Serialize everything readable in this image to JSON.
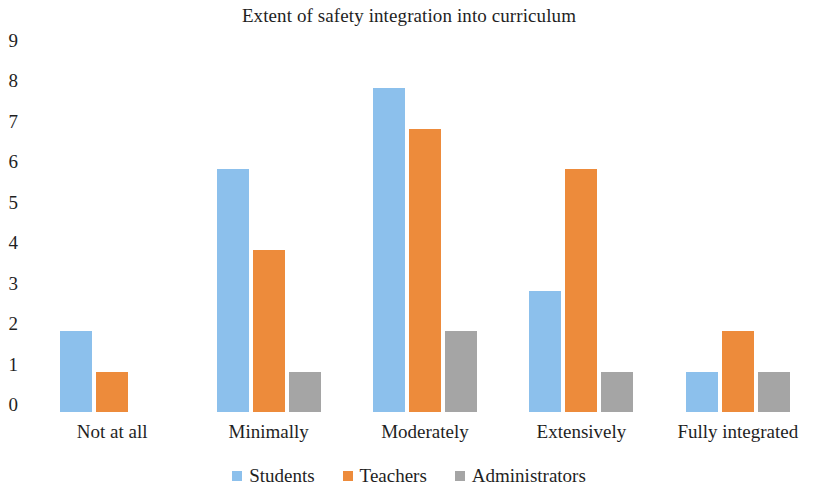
{
  "chart_data": {
    "type": "bar",
    "title": "Extent of safety integration into curriculum",
    "xlabel": "",
    "ylabel": "",
    "categories": [
      "Not at all",
      "Minimally",
      "Moderately",
      "Extensively",
      "Fully integrated"
    ],
    "series": [
      {
        "name": "Students",
        "color": "#8CC0EC",
        "values": [
          2,
          6,
          8,
          3,
          1
        ]
      },
      {
        "name": "Teachers",
        "color": "#ED8B3B",
        "values": [
          1,
          4,
          7,
          6,
          2
        ]
      },
      {
        "name": "Administrators",
        "color": "#A5A5A5",
        "values": [
          0,
          1,
          2,
          1,
          1
        ]
      }
    ],
    "ylim": [
      0,
      9
    ],
    "yticks": [
      9,
      8,
      7,
      6,
      5,
      4,
      3,
      2,
      1,
      0
    ],
    "ytick_labels": [
      "9",
      "8",
      "7",
      "6",
      "5",
      "4",
      "3",
      "2",
      "1",
      "0"
    ],
    "grid": false,
    "legend_position": "bottom"
  }
}
